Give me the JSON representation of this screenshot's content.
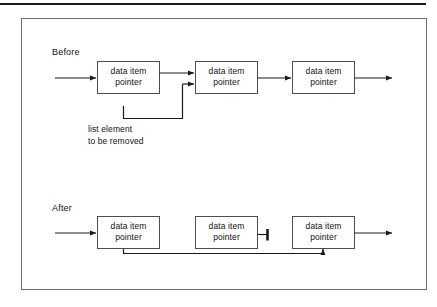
{
  "figure": {
    "sections": [
      {
        "id": "before",
        "label": "Before"
      },
      {
        "id": "after",
        "label": "After"
      }
    ],
    "annotation": {
      "line1": "list element",
      "line2": "to be removed"
    },
    "nodes": [
      {
        "id": "before-node-1",
        "line1": "data item",
        "line2": "pointer"
      },
      {
        "id": "before-node-2",
        "line1": "data item",
        "line2": "pointer"
      },
      {
        "id": "before-node-3",
        "line1": "data item",
        "line2": "pointer"
      },
      {
        "id": "after-node-1",
        "line1": "data item",
        "line2": "pointer"
      },
      {
        "id": "after-node-2",
        "line1": "data item",
        "line2": "pointer"
      },
      {
        "id": "after-node-3",
        "line1": "data item",
        "line2": "pointer"
      }
    ],
    "colors": {
      "stroke": "#1a1a1a",
      "box_border": "#4d4d4d",
      "frame_border": "#6e6e6e",
      "rule": "#1a1a1a",
      "background": "#ffffff",
      "text": "#111111"
    }
  }
}
